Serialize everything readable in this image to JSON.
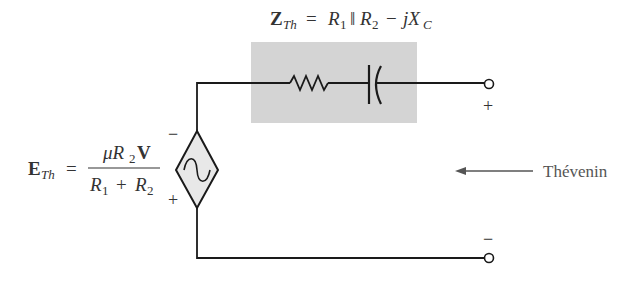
{
  "title_formula": {
    "lhs_main": "Z",
    "lhs_sub": "Th",
    "eq": "=",
    "r1": "R",
    "r1_sub": "1",
    "parallel": "‖",
    "r2": "R",
    "r2_sub": "2",
    "minus": "−",
    "jx": "jX",
    "jx_sub": "C"
  },
  "source_formula": {
    "lhs_main": "E",
    "lhs_sub": "Th",
    "eq": "=",
    "num_mu": "μR",
    "num_sub": "2",
    "num_v": "V",
    "den_r1": "R",
    "den_r1_sub": "1",
    "den_plus": "+",
    "den_r2": "R",
    "den_r2_sub": "2"
  },
  "source_polarity": {
    "top": "−",
    "bottom": "+"
  },
  "terminals": {
    "top": "+",
    "bottom": "−"
  },
  "arrow_label": "Thévenin",
  "colors": {
    "wire": "#1a1a1a",
    "box": "#d4d4d4",
    "source_fill": "#e8e8e8"
  }
}
